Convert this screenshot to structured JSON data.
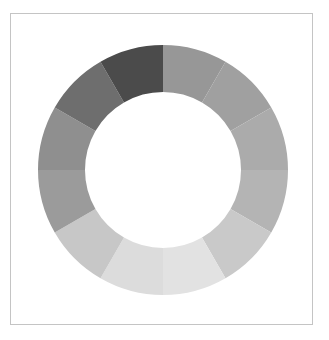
{
  "figure": {
    "background_color": "#ffffff",
    "frame": {
      "border_color": "#c4c4c4",
      "fill_color": "#ffffff",
      "x": 10,
      "y": 13,
      "width": 303,
      "height": 312
    }
  },
  "chart_data": {
    "type": "pie",
    "variant": "donut",
    "title": "",
    "subtitle": "",
    "xlabel": "",
    "ylabel": "",
    "grid": false,
    "legend": "none",
    "center_x": 163,
    "center_y": 170,
    "outer_radius": 125,
    "inner_radius": 78,
    "start_angle_deg": -90,
    "direction": "clockwise",
    "hole_color": "#ffffff",
    "categories": [
      "Segment 1",
      "Segment 2",
      "Segment 3",
      "Segment 4",
      "Segment 5",
      "Segment 6",
      "Segment 7",
      "Segment 8",
      "Segment 9",
      "Segment 10",
      "Segment 11",
      "Segment 12"
    ],
    "values": [
      8.33,
      8.33,
      8.33,
      8.33,
      8.33,
      8.33,
      8.33,
      8.33,
      8.33,
      8.33,
      8.33,
      8.33
    ],
    "colors": [
      "#979797",
      "#a0a0a0",
      "#ababab",
      "#b4b4b4",
      "#c9c9c9",
      "#e2e2e2",
      "#dcdcdc",
      "#c7c7c7",
      "#9b9b9b",
      "#8f8f8f",
      "#6e6e6e",
      "#4b4b4b"
    ],
    "segments": [
      {
        "label": "Segment 1",
        "value": 8.33,
        "color": "#979797",
        "start_deg": -90,
        "end_deg": -60
      },
      {
        "label": "Segment 2",
        "value": 8.33,
        "color": "#a0a0a0",
        "start_deg": -60,
        "end_deg": -30
      },
      {
        "label": "Segment 3",
        "value": 8.33,
        "color": "#ababab",
        "start_deg": -30,
        "end_deg": 0
      },
      {
        "label": "Segment 4",
        "value": 8.33,
        "color": "#b4b4b4",
        "start_deg": 0,
        "end_deg": 30
      },
      {
        "label": "Segment 5",
        "value": 8.33,
        "color": "#c9c9c9",
        "start_deg": 30,
        "end_deg": 60
      },
      {
        "label": "Segment 6",
        "value": 8.33,
        "color": "#e2e2e2",
        "start_deg": 60,
        "end_deg": 90
      },
      {
        "label": "Segment 7",
        "value": 8.33,
        "color": "#dcdcdc",
        "start_deg": 90,
        "end_deg": 120
      },
      {
        "label": "Segment 8",
        "value": 8.33,
        "color": "#c7c7c7",
        "start_deg": 120,
        "end_deg": 150
      },
      {
        "label": "Segment 9",
        "value": 8.33,
        "color": "#9b9b9b",
        "start_deg": 150,
        "end_deg": 180
      },
      {
        "label": "Segment 10",
        "value": 8.33,
        "color": "#8f8f8f",
        "start_deg": 180,
        "end_deg": 210
      },
      {
        "label": "Segment 11",
        "value": 8.33,
        "color": "#6e6e6e",
        "start_deg": 210,
        "end_deg": 240
      },
      {
        "label": "Segment 12",
        "value": 8.33,
        "color": "#4b4b4b",
        "start_deg": 240,
        "end_deg": 270
      }
    ]
  }
}
